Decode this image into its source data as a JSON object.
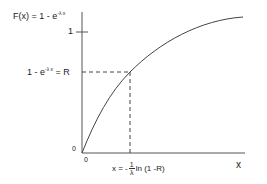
{
  "title": {
    "prefix": "F(x) = 1 - e",
    "exponent": "-λ x"
  },
  "y_tick_one": "1",
  "r_label": {
    "prefix": "1 - e",
    "exponent": "-λ x",
    "suffix": "= R"
  },
  "origin_y_label": "0",
  "origin_x_label": "0",
  "x_axis_label": "x",
  "x_formula": {
    "prefix": "x = -",
    "frac_num": "1",
    "frac_den": "λ",
    "suffix": "ln (1 -R)"
  },
  "colors": {
    "axis": "#555555",
    "curve": "#444444",
    "dashed": "#444444"
  }
}
